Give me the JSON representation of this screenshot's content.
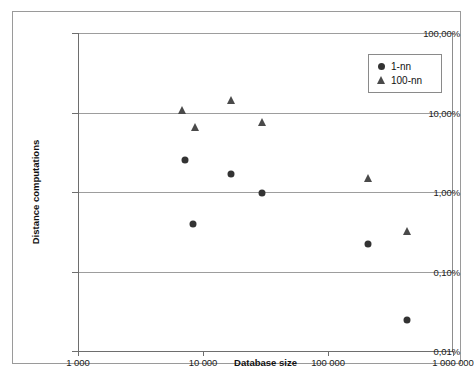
{
  "chart_data": {
    "type": "scatter",
    "title": "",
    "xlabel": "Database size",
    "ylabel": "Distance computations",
    "xscale": "log",
    "yscale": "log",
    "xlim": [
      1000,
      1000000
    ],
    "ylim": [
      0.0001,
      1.0
    ],
    "grid": "horizontal",
    "legend_position": "top-right",
    "xticks": [
      {
        "value": 1000,
        "label": "1 000"
      },
      {
        "value": 10000,
        "label": "10 000"
      },
      {
        "value": 100000,
        "label": "100 000"
      },
      {
        "value": 1000000,
        "label": "1 000 000"
      }
    ],
    "yticks": [
      {
        "value": 1.0,
        "label": "100,00%"
      },
      {
        "value": 0.1,
        "label": "10,00%"
      },
      {
        "value": 0.01,
        "label": "1,00%"
      },
      {
        "value": 0.001,
        "label": "0,10%"
      },
      {
        "value": 0.0001,
        "label": "0,01%"
      }
    ],
    "series": [
      {
        "name": "1-nn",
        "marker": "circle",
        "color": "#333333",
        "points": [
          {
            "x": 7000,
            "y": 0.0255
          },
          {
            "x": 8200,
            "y": 0.004
          },
          {
            "x": 16500,
            "y": 0.017
          },
          {
            "x": 29000,
            "y": 0.0096
          },
          {
            "x": 205000,
            "y": 0.0022
          },
          {
            "x": 420000,
            "y": 0.000245
          }
        ]
      },
      {
        "name": "100-nn",
        "marker": "triangle",
        "color": "#4a4a4a",
        "points": [
          {
            "x": 6700,
            "y": 0.108
          },
          {
            "x": 8400,
            "y": 0.065
          },
          {
            "x": 16500,
            "y": 0.143
          },
          {
            "x": 29000,
            "y": 0.076
          },
          {
            "x": 205000,
            "y": 0.015
          },
          {
            "x": 420000,
            "y": 0.0032
          }
        ]
      }
    ]
  },
  "legend": {
    "items": [
      {
        "label": "1-nn",
        "marker": "circle"
      },
      {
        "label": "100-nn",
        "marker": "triangle"
      }
    ]
  }
}
